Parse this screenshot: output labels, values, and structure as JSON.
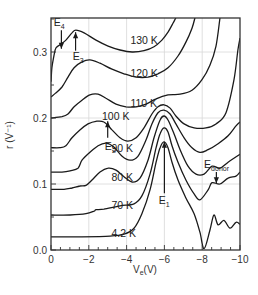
{
  "chart_data": {
    "type": "line",
    "title": "",
    "xlabel": "V_e(V)",
    "xlabel_main": "V",
    "xlabel_sub": "e",
    "xlabel_suffix": "(V)",
    "ylabel": "r (V⁻¹)",
    "xlim": [
      0,
      -10
    ],
    "ylim": [
      0,
      0.36
    ],
    "grid": true,
    "x_ticks": [
      0,
      -2,
      -4,
      -6,
      -8,
      -10
    ],
    "x_tick_labels": [
      "0",
      "−2",
      "−4",
      "−6",
      "−8",
      "−10"
    ],
    "y_ticks": [
      0.0,
      0.1,
      0.2,
      0.3
    ],
    "y_tick_labels": [
      "0.0",
      "0.1",
      "0.2",
      "0.3"
    ],
    "legend": "none (curves labeled inline)",
    "series": [
      {
        "name": "130 K",
        "label": "130 K",
        "label_at": [
          -4.2,
          0.312
        ],
        "x": [
          0,
          -0.05,
          -0.16,
          -0.26,
          -0.48,
          -0.79,
          -1.11,
          -1.32,
          -1.75,
          -2.38,
          -3.02,
          -3.65,
          -4.29,
          -4.92,
          -5.45,
          -5.87,
          -6.19,
          -6.46,
          -6.61
        ],
        "y": [
          0.255,
          0.276,
          0.295,
          0.306,
          0.311,
          0.318,
          0.329,
          0.333,
          0.329,
          0.318,
          0.309,
          0.303,
          0.3,
          0.302,
          0.308,
          0.318,
          0.33,
          0.344,
          0.352
        ]
      },
      {
        "name": "120 K",
        "label": "120 K",
        "label_at": [
          -4.2,
          0.262
        ],
        "x": [
          0,
          -0.26,
          -0.58,
          -0.9,
          -1.22,
          -1.64,
          -2.06,
          -2.59,
          -3.23,
          -3.86,
          -4.5,
          -5.13,
          -5.66,
          -6.19,
          -6.72,
          -7.14,
          -7.46,
          -7.62
        ],
        "y": [
          0.232,
          0.238,
          0.247,
          0.262,
          0.276,
          0.285,
          0.288,
          0.283,
          0.274,
          0.267,
          0.262,
          0.262,
          0.267,
          0.276,
          0.294,
          0.315,
          0.336,
          0.352
        ]
      },
      {
        "name": "110 K",
        "label": "110 K",
        "label_at": [
          -4.2,
          0.217
        ],
        "x": [
          0,
          -0.58,
          -0.9,
          -1.22,
          -1.64,
          -2.06,
          -2.49,
          -2.91,
          -3.44,
          -3.97,
          -4.5,
          -5.03,
          -5.56,
          -6.19,
          -6.83,
          -7.46,
          -7.99,
          -8.41,
          -8.73,
          -8.94
        ],
        "y": [
          0.2,
          0.202,
          0.206,
          0.217,
          0.227,
          0.235,
          0.236,
          0.23,
          0.221,
          0.217,
          0.217,
          0.221,
          0.229,
          0.235,
          0.236,
          0.242,
          0.258,
          0.28,
          0.309,
          0.352
        ]
      },
      {
        "name": "100 K",
        "label": "100 K",
        "label_at": [
          -2.7,
          0.197
        ],
        "x": [
          0,
          -0.48,
          -0.79,
          -1.11,
          -1.53,
          -1.96,
          -2.38,
          -2.8,
          -3.23,
          -3.65,
          -4.07,
          -4.5,
          -4.92,
          -5.34,
          -5.66,
          -5.98,
          -6.3,
          -6.61,
          -7.04,
          -7.57,
          -8.2,
          -8.73,
          -9.26,
          -9.68,
          -9.89,
          -10.0
        ],
        "y": [
          0.155,
          0.155,
          0.158,
          0.17,
          0.182,
          0.191,
          0.195,
          0.194,
          0.182,
          0.17,
          0.165,
          0.17,
          0.185,
          0.206,
          0.217,
          0.22,
          0.215,
          0.203,
          0.191,
          0.185,
          0.185,
          0.191,
          0.208,
          0.258,
          0.303,
          0.321
        ]
      },
      {
        "name": "90 K",
        "label": "90 K",
        "label_at": [
          -3.2,
          0.148
        ],
        "x": [
          0,
          -0.58,
          -1.01,
          -1.43,
          -1.64,
          -2.06,
          -2.49,
          -2.91,
          -3.33,
          -3.76,
          -4.18,
          -4.6,
          -5.03,
          -5.34,
          -5.66,
          -5.98,
          -6.3,
          -6.61,
          -7.04,
          -7.46,
          -7.88,
          -8.31,
          -8.84,
          -9.37,
          -9.79,
          -10.0
        ],
        "y": [
          0.118,
          0.118,
          0.12,
          0.124,
          0.136,
          0.148,
          0.158,
          0.162,
          0.156,
          0.142,
          0.136,
          0.142,
          0.167,
          0.191,
          0.208,
          0.212,
          0.206,
          0.191,
          0.17,
          0.155,
          0.148,
          0.152,
          0.161,
          0.173,
          0.188,
          0.194
        ]
      },
      {
        "name": "80 K",
        "label": "80 K",
        "label_at": [
          -3.2,
          0.105
        ],
        "x": [
          0,
          -0.69,
          -1.11,
          -1.53,
          -1.85,
          -2.17,
          -2.59,
          -3.02,
          -3.44,
          -3.86,
          -4.29,
          -4.71,
          -5.13,
          -5.45,
          -5.77,
          -5.98,
          -6.19,
          -6.51,
          -6.83,
          -7.25,
          -7.67,
          -8.1,
          -8.52,
          -8.94,
          -9.37,
          -10.0
        ],
        "y": [
          0.092,
          0.092,
          0.094,
          0.097,
          0.098,
          0.106,
          0.118,
          0.124,
          0.121,
          0.111,
          0.103,
          0.109,
          0.136,
          0.17,
          0.197,
          0.203,
          0.197,
          0.176,
          0.152,
          0.127,
          0.115,
          0.115,
          0.127,
          0.124,
          0.133,
          0.145
        ]
      },
      {
        "name": "70 K",
        "label": "70 K",
        "label_at": [
          -3.2,
          0.062
        ],
        "x": [
          0,
          -1.01,
          -1.85,
          -2.28,
          -2.38,
          -2.8,
          -3.65,
          -4.39,
          -4.81,
          -5.24,
          -5.56,
          -5.77,
          -5.98,
          -6.19,
          -6.4,
          -6.72,
          -7.14,
          -7.57,
          -7.88,
          -8.31,
          -8.52,
          -8.94,
          -9.37,
          -9.79,
          -10.0
        ],
        "y": [
          0.053,
          0.053,
          0.055,
          0.059,
          0.061,
          0.062,
          0.067,
          0.07,
          0.082,
          0.115,
          0.155,
          0.176,
          0.185,
          0.179,
          0.158,
          0.133,
          0.106,
          0.085,
          0.076,
          0.091,
          0.102,
          0.1,
          0.109,
          0.112,
          0.118
        ]
      },
      {
        "name": "4.2 K",
        "label": "4.2 K",
        "label_at": [
          -3.2,
          0.02
        ],
        "x": [
          0,
          -1.53,
          -3.12,
          -3.86,
          -4.39,
          -4.81,
          -5.24,
          -5.56,
          -5.77,
          -5.98,
          -6.19,
          -6.4,
          -6.72,
          -7.14,
          -7.57,
          -7.88,
          -8.1,
          -8.41,
          -8.62,
          -8.84,
          -9.15,
          -9.47,
          -9.79,
          -10.0
        ],
        "y": [
          0.02,
          0.02,
          0.021,
          0.024,
          0.033,
          0.055,
          0.091,
          0.133,
          0.155,
          0.164,
          0.155,
          0.133,
          0.106,
          0.079,
          0.055,
          0.027,
          0.002,
          0.03,
          0.053,
          0.038,
          0.045,
          0.033,
          0.042,
          0.039
        ]
      }
    ],
    "annotations": [
      {
        "name": "E4",
        "text": "E",
        "sub": "4",
        "arrow_from": [
          -0.55,
          0.333
        ],
        "arrow_to": [
          -0.55,
          0.305
        ],
        "text_at": [
          -0.15,
          0.34
        ]
      },
      {
        "name": "E3",
        "text": "E",
        "sub": "3",
        "arrow_from": [
          -1.3,
          0.302
        ],
        "arrow_to": [
          -1.3,
          0.33
        ],
        "text_at": [
          -1.15,
          0.288
        ]
      },
      {
        "name": "E2",
        "text": "E",
        "sub": "2",
        "arrow_from": [
          -3.0,
          0.17
        ],
        "arrow_to": [
          -3.0,
          0.195
        ],
        "text_at": [
          -2.85,
          0.152
        ]
      },
      {
        "name": "E1",
        "text": "E",
        "sub": "1",
        "arrow_from": [
          -6.0,
          0.086
        ],
        "arrow_to": [
          -6.0,
          0.164
        ],
        "text_at": [
          -5.7,
          0.07
        ]
      },
      {
        "name": "Edonor",
        "text": "E",
        "sub": "donor",
        "arrow_from": [
          -8.75,
          0.118
        ],
        "arrow_to": [
          -8.75,
          0.101
        ],
        "text_at": [
          -8.1,
          0.125
        ]
      }
    ]
  }
}
